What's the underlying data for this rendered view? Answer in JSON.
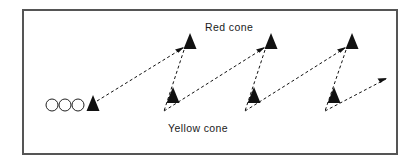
{
  "diagram": {
    "frame": {
      "x": 22,
      "y": 9,
      "width": 376,
      "height": 146,
      "border_color": "#555555",
      "border_width": 2,
      "fill_color": "#ffffff"
    },
    "labels": [
      {
        "id": "red-cone-label",
        "text": "Red cone",
        "x": 205,
        "y": 31
      },
      {
        "id": "yellow-cone-label",
        "text": "Yellow cone",
        "x": 168,
        "y": 132
      }
    ],
    "players": {
      "name": "player-queue",
      "shape": "circle",
      "radius": 6,
      "stroke_color": "#222222",
      "fill_color": "#ffffff",
      "positions": [
        {
          "cx": 52,
          "cy": 105
        },
        {
          "cx": 65,
          "cy": 105
        },
        {
          "cx": 78,
          "cy": 105
        }
      ]
    },
    "cones": {
      "fill_color": "#111111",
      "start": [
        {
          "id": "start-cone",
          "x": 93,
          "y": 105,
          "size": 11
        }
      ],
      "red": [
        {
          "id": "red-cone-1",
          "x": 190,
          "y": 42,
          "size": 11
        },
        {
          "id": "red-cone-2",
          "x": 271,
          "y": 42,
          "size": 11
        },
        {
          "id": "red-cone-3",
          "x": 352,
          "y": 42,
          "size": 11
        }
      ],
      "yellow": [
        {
          "id": "yellow-cone-1",
          "x": 173,
          "y": 96,
          "size": 11
        },
        {
          "id": "yellow-cone-2",
          "x": 254,
          "y": 96,
          "size": 11
        },
        {
          "id": "yellow-cone-3",
          "x": 334,
          "y": 96,
          "size": 11
        }
      ]
    },
    "paths": {
      "stroke_color": "#111111",
      "stroke_width": 1,
      "dash_pattern": "3,2.5",
      "segments": [
        {
          "id": "run-1-up",
          "x1": 97,
          "y1": 101,
          "x2": 183,
          "y2": 48,
          "arrow": true
        },
        {
          "id": "run-1-down",
          "x1": 184,
          "y1": 50,
          "x2": 164,
          "y2": 111,
          "arrow": false
        },
        {
          "id": "run-2-up",
          "x1": 164,
          "y1": 111,
          "x2": 264,
          "y2": 48,
          "arrow": true
        },
        {
          "id": "run-2-down",
          "x1": 265,
          "y1": 50,
          "x2": 245,
          "y2": 111,
          "arrow": false
        },
        {
          "id": "run-3-up",
          "x1": 245,
          "y1": 111,
          "x2": 345,
          "y2": 48,
          "arrow": true
        },
        {
          "id": "run-3-down",
          "x1": 346,
          "y1": 50,
          "x2": 325,
          "y2": 111,
          "arrow": false
        },
        {
          "id": "run-exit",
          "x1": 325,
          "y1": 111,
          "x2": 386,
          "y2": 79,
          "arrow": true
        }
      ]
    }
  }
}
